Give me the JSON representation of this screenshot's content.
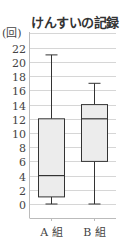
{
  "chart_data": {
    "type": "boxplot",
    "title": "けんすいの記録",
    "ylabel": "(回)",
    "xlabel": "",
    "ylim": [
      0,
      22
    ],
    "yticks": [
      0,
      2,
      4,
      6,
      8,
      10,
      12,
      14,
      16,
      18,
      20,
      22
    ],
    "grid": true,
    "categories": [
      "A 組",
      "B 組"
    ],
    "series": [
      {
        "name": "A 組",
        "min": 0,
        "q1": 1,
        "median": 4,
        "q3": 12,
        "max": 21
      },
      {
        "name": "B 組",
        "min": 0,
        "q1": 6,
        "median": 12,
        "q3": 14,
        "max": 17
      }
    ],
    "colors": {
      "box_fill": "#ececec",
      "line": "#333333",
      "grid": "#cccccc"
    }
  }
}
